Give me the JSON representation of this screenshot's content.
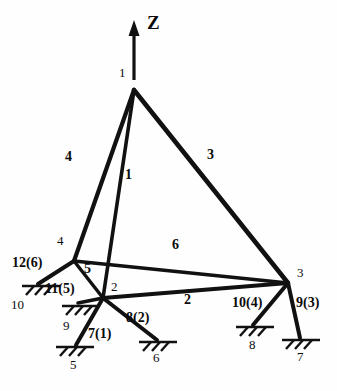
{
  "figure": {
    "type": "structural-truss-diagram",
    "background_color": "#fefefe",
    "line_color": "#111111",
    "axis": {
      "label": "Z",
      "direction": "up",
      "origin_node": "1",
      "x": 147,
      "y": 22,
      "arrow": {
        "x1": 134,
        "y1": 80,
        "x2": 134,
        "y2": 24
      }
    },
    "nodes": [
      {
        "id": "1",
        "label": "1",
        "x": 134,
        "y": 90,
        "label_x": 119,
        "label_y": 72
      },
      {
        "id": "2",
        "label": "2",
        "x": 103,
        "y": 298,
        "label_x": 111,
        "label_y": 286
      },
      {
        "id": "3",
        "label": "3",
        "x": 288,
        "y": 283,
        "label_x": 297,
        "label_y": 272
      },
      {
        "id": "4",
        "label": "4",
        "x": 74,
        "y": 261,
        "label_x": 57,
        "label_y": 240
      }
    ],
    "members": [
      {
        "id": "1",
        "label": "1",
        "from": "1",
        "to": "2",
        "label_x": 125,
        "label_y": 175
      },
      {
        "id": "2",
        "label": "2",
        "from": "2",
        "to": "3",
        "label_x": 184,
        "label_y": 300
      },
      {
        "id": "3",
        "label": "3",
        "from": "1",
        "to": "3",
        "label_x": 207,
        "label_y": 155
      },
      {
        "id": "4",
        "label": "4",
        "from": "1",
        "to": "4",
        "label_x": 65,
        "label_y": 157
      },
      {
        "id": "5",
        "label": "5",
        "from": "4",
        "to": "2",
        "label_x": 84,
        "label_y": 269
      },
      {
        "id": "6",
        "label": "6",
        "from": "4",
        "to": "3",
        "label_x": 172,
        "label_y": 245
      }
    ],
    "supports": [
      {
        "id": "5",
        "label": "5",
        "node": "2",
        "dof_label": "7(1)",
        "tip_x": 74,
        "tip_y": 345,
        "label_x": 70,
        "label_y": 365,
        "dof_x": 90,
        "dof_y": 333,
        "hatch_angle": 0
      },
      {
        "id": "6",
        "label": "6",
        "node": "2",
        "dof_label": "8(2)",
        "tip_x": 157,
        "tip_y": 340,
        "label_x": 153,
        "label_y": 358,
        "dof_x": 128,
        "dof_y": 317,
        "hatch_angle": 0
      },
      {
        "id": "7",
        "label": "7",
        "node": "3",
        "dof_label": "9(3)",
        "tip_x": 300,
        "tip_y": 338,
        "label_x": 297,
        "label_y": 357,
        "dof_x": 298,
        "dof_y": 303,
        "hatch_angle": 0
      },
      {
        "id": "8",
        "label": "8",
        "node": "3",
        "dof_label": "10(4)",
        "tip_x": 253,
        "tip_y": 325,
        "label_x": 249,
        "label_y": 345,
        "dof_x": 236,
        "dof_y": 303,
        "hatch_angle": 0
      },
      {
        "id": "9",
        "label": "9",
        "node": "2",
        "dof_label": "11(5)",
        "tip_x": 80,
        "tip_y": 305,
        "label_x": 63,
        "label_y": 326,
        "dof_x": 51,
        "dof_y": 289,
        "hatch_angle": 0
      },
      {
        "id": "10",
        "label": "10",
        "node": "4",
        "dof_label": "12(6)",
        "tip_x": 39,
        "tip_y": 284,
        "label_x": 12,
        "label_y": 305,
        "dof_x": 14,
        "dof_y": 262,
        "hatch_angle": 0
      }
    ]
  }
}
